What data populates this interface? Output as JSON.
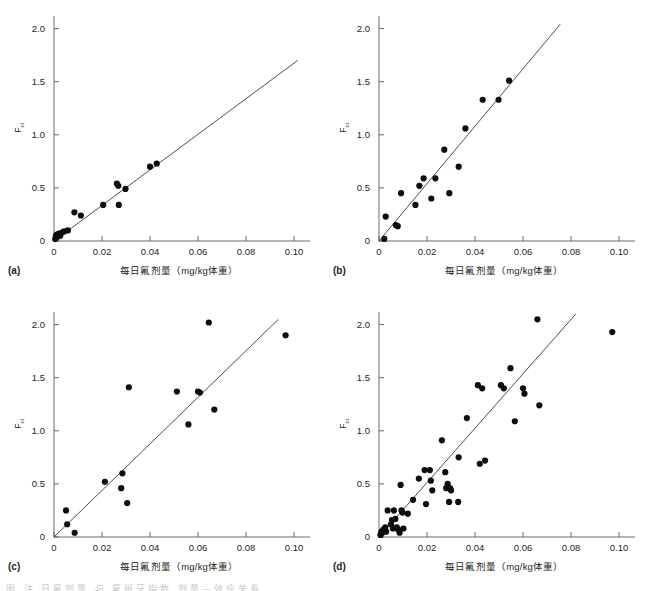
{
  "figure": {
    "background_color": "#ffffff",
    "point_color": "#0d0d0d",
    "line_color": "#3a3a3a",
    "axis_color": "#58595b",
    "xlabel": "每日氟剂量（mg/kg体重）",
    "ylabel_main": "F",
    "ylabel_sub": "ci",
    "footer_partial_text": "图  注     日氟剂量    与        氟斑牙指数     剂量—效应关系"
  },
  "chart_data": [
    {
      "type": "scatter",
      "panel": "(a)",
      "title": "",
      "xlabel": "每日氟剂量（mg/kg体重）",
      "ylabel": "Fci",
      "xlim": [
        0,
        0.105
      ],
      "ylim": [
        0,
        2.1
      ],
      "xticks": [
        0,
        0.02,
        0.04,
        0.06,
        0.08,
        0.1
      ],
      "xticklabels": [
        "0",
        "0.02",
        "0.04",
        "0.06",
        "0.08",
        "0.10"
      ],
      "yticks": [
        0,
        0.5,
        1.0,
        1.5,
        2.0
      ],
      "yticklabels": [
        "0",
        "0.5",
        "1.0",
        "1.5",
        "2.0"
      ],
      "grid": false,
      "legend": "none",
      "fit_line": {
        "x": [
          0.0,
          0.1015
        ],
        "y": [
          0.0,
          1.7
        ]
      },
      "points": [
        [
          0.0005,
          0.02
        ],
        [
          0.0008,
          0.05
        ],
        [
          0.0012,
          0.06
        ],
        [
          0.0015,
          0.04
        ],
        [
          0.002,
          0.07
        ],
        [
          0.0026,
          0.05
        ],
        [
          0.0033,
          0.08
        ],
        [
          0.0042,
          0.09
        ],
        [
          0.0058,
          0.1
        ],
        [
          0.0085,
          0.27
        ],
        [
          0.0112,
          0.24
        ],
        [
          0.0205,
          0.34
        ],
        [
          0.0262,
          0.54
        ],
        [
          0.0268,
          0.52
        ],
        [
          0.027,
          0.34
        ],
        [
          0.0298,
          0.49
        ],
        [
          0.04,
          0.7
        ],
        [
          0.0428,
          0.73
        ]
      ]
    },
    {
      "type": "scatter",
      "panel": "(b)",
      "title": "",
      "xlabel": "每日氟剂量（mg/kg体重）",
      "ylabel": "Fci",
      "xlim": [
        0,
        0.105
      ],
      "ylim": [
        0,
        2.1
      ],
      "xticks": [
        0,
        0.02,
        0.04,
        0.06,
        0.08,
        0.1
      ],
      "xticklabels": [
        "0",
        "0.02",
        "0.04",
        "0.06",
        "0.08",
        "0.10"
      ],
      "yticks": [
        0,
        0.5,
        1.0,
        1.5,
        2.0
      ],
      "yticklabels": [
        "0",
        "0.5",
        "1.0",
        "1.5",
        "2.0"
      ],
      "grid": false,
      "legend": "none",
      "fit_line": {
        "x": [
          0.0,
          0.0755
        ],
        "y": [
          0.0,
          2.04
        ]
      },
      "points": [
        [
          0.0022,
          0.02
        ],
        [
          0.0028,
          0.23
        ],
        [
          0.007,
          0.15
        ],
        [
          0.0078,
          0.14
        ],
        [
          0.0092,
          0.45
        ],
        [
          0.0152,
          0.34
        ],
        [
          0.0168,
          0.52
        ],
        [
          0.0186,
          0.59
        ],
        [
          0.0218,
          0.4
        ],
        [
          0.0235,
          0.59
        ],
        [
          0.0272,
          0.86
        ],
        [
          0.0293,
          0.45
        ],
        [
          0.0332,
          0.7
        ],
        [
          0.036,
          1.06
        ],
        [
          0.0432,
          1.33
        ],
        [
          0.0498,
          1.33
        ],
        [
          0.0542,
          1.51
        ]
      ]
    },
    {
      "type": "scatter",
      "panel": "(c)",
      "title": "",
      "xlabel": "每日氟剂量（mg/kg体重）",
      "ylabel": "Fci",
      "xlim": [
        0,
        0.105
      ],
      "ylim": [
        0,
        2.1
      ],
      "xticks": [
        0,
        0.02,
        0.04,
        0.06,
        0.08,
        0.1
      ],
      "xticklabels": [
        "0",
        "0.02",
        "0.04",
        "0.06",
        "0.08",
        "0.10"
      ],
      "yticks": [
        0,
        0.5,
        1.0,
        1.5,
        2.0
      ],
      "yticklabels": [
        "0",
        "0.5",
        "1.0",
        "1.5",
        "2.0"
      ],
      "grid": false,
      "legend": "none",
      "fit_line": {
        "x": [
          0.0,
          0.0935
        ],
        "y": [
          0.0,
          2.05
        ]
      },
      "points": [
        [
          0.005,
          0.25
        ],
        [
          0.0055,
          0.12
        ],
        [
          0.0086,
          0.04
        ],
        [
          0.0212,
          0.52
        ],
        [
          0.028,
          0.46
        ],
        [
          0.0285,
          0.6
        ],
        [
          0.0305,
          0.32
        ],
        [
          0.0312,
          1.41
        ],
        [
          0.0512,
          1.37
        ],
        [
          0.056,
          1.06
        ],
        [
          0.06,
          1.37
        ],
        [
          0.0608,
          1.36
        ],
        [
          0.0645,
          2.02
        ],
        [
          0.0668,
          1.2
        ],
        [
          0.0965,
          1.9
        ]
      ]
    },
    {
      "type": "scatter",
      "panel": "(d)",
      "title": "",
      "xlabel": "每日氟剂量（mg/kg体重）",
      "ylabel": "Fci",
      "xlim": [
        0,
        0.105
      ],
      "ylim": [
        0,
        2.1
      ],
      "xticks": [
        0,
        0.02,
        0.04,
        0.06,
        0.08,
        0.1
      ],
      "xticklabels": [
        "0",
        "0.02",
        "0.04",
        "0.06",
        "0.08",
        "0.10"
      ],
      "yticks": [
        0,
        0.5,
        1.0,
        1.5,
        2.0
      ],
      "yticklabels": [
        "0",
        "0.5",
        "1.0",
        "1.5",
        "2.0"
      ],
      "grid": false,
      "legend": "none",
      "fit_line": {
        "x": [
          0.0,
          0.082
        ],
        "y": [
          0.0,
          2.1
        ]
      },
      "points": [
        [
          0.0006,
          0.02
        ],
        [
          0.001,
          0.05
        ],
        [
          0.0014,
          0.04
        ],
        [
          0.0018,
          0.07
        ],
        [
          0.0022,
          0.06
        ],
        [
          0.0026,
          0.09
        ],
        [
          0.003,
          0.05
        ],
        [
          0.0036,
          0.25
        ],
        [
          0.005,
          0.12
        ],
        [
          0.0054,
          0.16
        ],
        [
          0.0058,
          0.08
        ],
        [
          0.0062,
          0.25
        ],
        [
          0.0068,
          0.17
        ],
        [
          0.0074,
          0.09
        ],
        [
          0.008,
          0.07
        ],
        [
          0.0086,
          0.04
        ],
        [
          0.009,
          0.49
        ],
        [
          0.0094,
          0.25
        ],
        [
          0.0098,
          0.23
        ],
        [
          0.0102,
          0.08
        ],
        [
          0.012,
          0.22
        ],
        [
          0.0142,
          0.35
        ],
        [
          0.0166,
          0.55
        ],
        [
          0.019,
          0.63
        ],
        [
          0.0196,
          0.31
        ],
        [
          0.0212,
          0.63
        ],
        [
          0.0216,
          0.53
        ],
        [
          0.0222,
          0.44
        ],
        [
          0.0262,
          0.91
        ],
        [
          0.0276,
          0.61
        ],
        [
          0.028,
          0.46
        ],
        [
          0.0286,
          0.5
        ],
        [
          0.0292,
          0.33
        ],
        [
          0.0296,
          0.46
        ],
        [
          0.03,
          0.44
        ],
        [
          0.033,
          0.33
        ],
        [
          0.0332,
          0.75
        ],
        [
          0.0366,
          1.12
        ],
        [
          0.0412,
          1.43
        ],
        [
          0.042,
          0.69
        ],
        [
          0.043,
          1.4
        ],
        [
          0.0442,
          0.72
        ],
        [
          0.0508,
          1.43
        ],
        [
          0.052,
          1.4
        ],
        [
          0.0548,
          1.59
        ],
        [
          0.0566,
          1.09
        ],
        [
          0.06,
          1.4
        ],
        [
          0.0606,
          1.35
        ],
        [
          0.066,
          2.05
        ],
        [
          0.0668,
          1.24
        ],
        [
          0.0972,
          1.93
        ]
      ]
    }
  ],
  "panels": [
    {
      "tag": "(a)"
    },
    {
      "tag": "(b)"
    },
    {
      "tag": "(c)"
    },
    {
      "tag": "(d)"
    }
  ]
}
